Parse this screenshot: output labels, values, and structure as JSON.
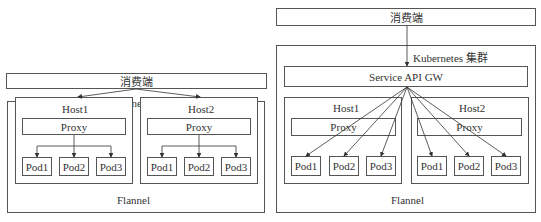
{
  "left": {
    "consumer": "消费端",
    "cluster": "Kubernetes 集群",
    "network": "Flannel",
    "hosts": [
      {
        "name": "Host1",
        "proxy": "Proxy",
        "pods": [
          "Pod1",
          "Pod2",
          "Pod3"
        ]
      },
      {
        "name": "Host2",
        "proxy": "Proxy",
        "pods": [
          "Pod1",
          "Pod2",
          "Pod3"
        ]
      }
    ]
  },
  "right": {
    "consumer": "消费端",
    "cluster": "Kubernetes 集群",
    "gateway": "Service API GW",
    "network": "Flannel",
    "hosts": [
      {
        "name": "Host1",
        "proxy": "Proxy",
        "pods": [
          "Pod1",
          "Pod2",
          "Pod3"
        ]
      },
      {
        "name": "Host2",
        "proxy": "Proxy",
        "pods": [
          "Pod1",
          "Pod2",
          "Pod3"
        ]
      }
    ]
  }
}
